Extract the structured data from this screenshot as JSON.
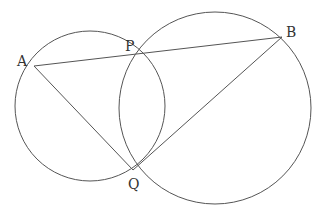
{
  "diagram": {
    "type": "two intersecting circles with chords",
    "colors": {
      "line": "#555555",
      "label": "#333333",
      "background": "#ffffff"
    },
    "circles": [
      {
        "name": "left-circle",
        "cx": 90,
        "cy": 106,
        "r": 75
      },
      {
        "name": "right-circle",
        "cx": 215,
        "cy": 108,
        "r": 96
      }
    ],
    "points": {
      "A": {
        "x": 34,
        "y": 66,
        "label": "A",
        "lx": 17,
        "ly": 66
      },
      "P": {
        "x": 132,
        "y": 56,
        "label": "P",
        "lx": 125,
        "ly": 50
      },
      "B": {
        "x": 282,
        "y": 37,
        "label": "B",
        "lx": 286,
        "ly": 34
      },
      "Q": {
        "x": 133,
        "y": 170,
        "label": "Q",
        "lx": 128,
        "ly": 189
      }
    },
    "segments": [
      {
        "name": "segment-A-B",
        "from": "A",
        "to": "B"
      },
      {
        "name": "segment-A-Q",
        "from": "A",
        "to": "Q"
      },
      {
        "name": "segment-B-Q",
        "from": "B",
        "to": "Q"
      }
    ]
  }
}
